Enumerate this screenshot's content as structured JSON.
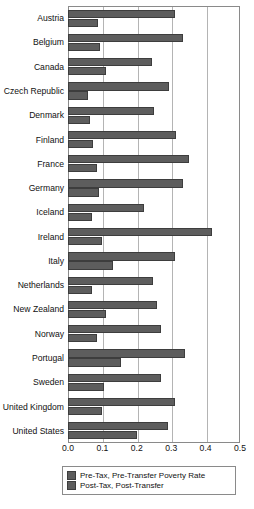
{
  "chart_data": {
    "type": "bar",
    "orientation": "horizontal",
    "title": "",
    "xlabel": "",
    "ylabel": "",
    "xlim": [
      0.0,
      0.5
    ],
    "xticks": [
      "0.0",
      "0.1",
      "0.2",
      "0.3",
      "0.4",
      "0.5"
    ],
    "xtick_values": [
      0.0,
      0.1,
      0.2,
      0.3,
      0.4,
      0.5
    ],
    "grid": true,
    "grid_axis": "x",
    "legend_position": "bottom",
    "bar_color": "#5d5d5d",
    "frame_color": "#8a8a8a",
    "categories": [
      "Austria",
      "Belgium",
      "Canada",
      "Czech Republic",
      "Denmark",
      "Finland",
      "France",
      "Germany",
      "Iceland",
      "Ireland",
      "Italy",
      "Netherlands",
      "New Zealand",
      "Norway",
      "Portugal",
      "Sweden",
      "United Kingdom",
      "United States"
    ],
    "series": [
      {
        "name": "Pre-Tax, Pre-Transfer Poverty Rate",
        "values": [
          0.31,
          0.335,
          0.245,
          0.295,
          0.25,
          0.315,
          0.352,
          0.335,
          0.22,
          0.42,
          0.31,
          0.247,
          0.26,
          0.27,
          0.34,
          0.27,
          0.31,
          0.29
        ]
      },
      {
        "name": "Post-Tax, Post-Transfer",
        "values": [
          0.087,
          0.093,
          0.11,
          0.058,
          0.065,
          0.073,
          0.085,
          0.09,
          0.07,
          0.1,
          0.13,
          0.07,
          0.11,
          0.085,
          0.155,
          0.105,
          0.1,
          0.2
        ]
      }
    ],
    "legend": [
      "Pre-Tax, Pre-Transfer Poverty Rate",
      "Post-Tax, Post-Transfer"
    ]
  }
}
